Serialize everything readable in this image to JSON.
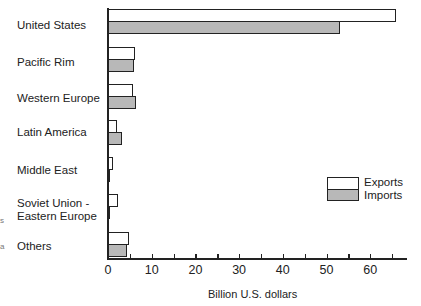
{
  "chart_data": {
    "type": "bar",
    "orientation": "horizontal",
    "title": "",
    "categories": [
      "United States",
      "Pacific Rim",
      "Western Europe",
      "Latin America",
      "Middle East",
      "Soviet Union - Eastern Europe",
      "Others"
    ],
    "series": [
      {
        "name": "Exports",
        "color": "#ffffff",
        "values": [
          66,
          6.2,
          5.8,
          2.0,
          1.2,
          2.3,
          4.7
        ]
      },
      {
        "name": "Imports",
        "color": "#b8b8b8",
        "values": [
          53,
          6.0,
          6.5,
          3.3,
          0.4,
          0.4,
          4.3
        ]
      }
    ],
    "xlabel": "Billion U.S. dollars",
    "ylabel": "",
    "xlim": [
      0,
      68
    ],
    "xticks": [
      0,
      10,
      20,
      30,
      40,
      50,
      60
    ],
    "grid": false,
    "legend_position": "right-middle"
  },
  "labels": {
    "cat0": "United States",
    "cat1": "Pacific Rim",
    "cat2": "Western Europe",
    "cat3": "Latin America",
    "cat4": "Middle East",
    "cat5a": "Soviet Union -",
    "cat5b": "Eastern Europe",
    "cat6": "Others",
    "xlabel": "Billion U.S. dollars",
    "legend_exports": "Exports",
    "legend_imports": "Imports",
    "ticks": [
      "0",
      "10",
      "20",
      "30",
      "40",
      "50",
      "60"
    ]
  }
}
